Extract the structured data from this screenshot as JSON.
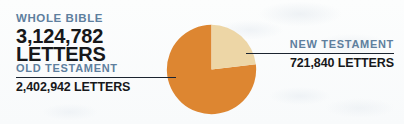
{
  "theme": {
    "background": "#fbfcfd",
    "kicker_color": "#5e7f9e",
    "value_color": "#17181a",
    "rule_color": "#1b2430",
    "old_testament_color": "#dd8631",
    "new_testament_color": "#edd6a6"
  },
  "whole_bible": {
    "kicker": "WHOLE BIBLE",
    "number": "3,124,782",
    "unit": "LETTERS"
  },
  "old_testament": {
    "kicker": "OLD TESTAMENT",
    "value": "2,402,942 LETTERS"
  },
  "new_testament": {
    "kicker": "NEW TESTAMENT",
    "value": "721,840 LETTERS"
  },
  "chart_data": {
    "type": "pie",
    "title": "WHOLE BIBLE 3,124,782 LETTERS",
    "total": 3124782,
    "unit": "letters",
    "labels": [
      "OLD TESTAMENT",
      "NEW TESTAMENT"
    ],
    "values": [
      2402942,
      721840
    ],
    "value_labels": [
      "2,402,942 LETTERS",
      "721,840 LETTERS"
    ],
    "percentages": [
      76.9,
      23.1
    ],
    "colors": [
      "#dd8631",
      "#edd6a6"
    ],
    "start_angle_deg": 0,
    "direction": "clockwise",
    "legend": "callout labels left and right",
    "grid": false
  }
}
